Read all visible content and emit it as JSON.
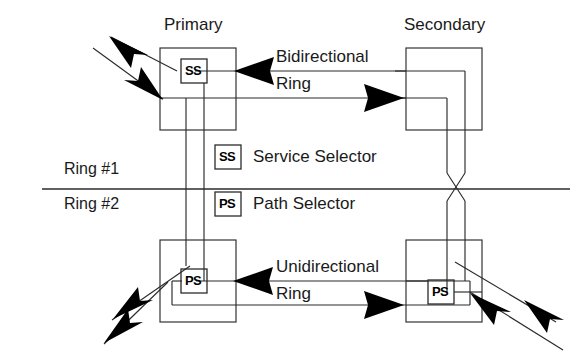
{
  "figure": {
    "nodes": [
      {
        "id": "primary",
        "title": "Primary",
        "selector": "SS"
      },
      {
        "id": "secondary",
        "title": "Secondary",
        "selector": ""
      },
      {
        "id": "bottom_left",
        "title": "",
        "selector": "PS"
      },
      {
        "id": "bottom_right",
        "title": "",
        "selector": "PS"
      }
    ],
    "ring_labels": {
      "upper": "Ring #1",
      "lower": "Ring #2"
    },
    "connection_labels": {
      "bidirectional_line1": "Bidirectional",
      "bidirectional_line2": "Ring",
      "unidirectional_line1": "Unidirectional",
      "unidirectional_line2": "Ring"
    },
    "legend": [
      {
        "symbol": "SS",
        "label": "Service Selector"
      },
      {
        "symbol": "PS",
        "label": "Path Selector"
      }
    ],
    "colors": {
      "stroke": "#2b2b2b",
      "arrow_fill": "#000000",
      "text": "#1a1a1a",
      "background": "#ffffff"
    }
  }
}
